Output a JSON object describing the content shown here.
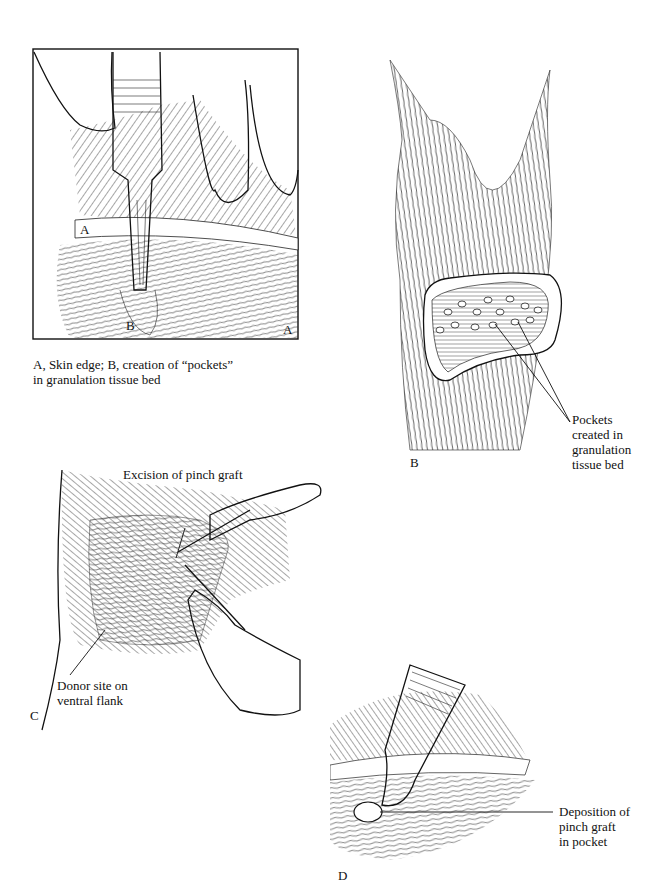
{
  "figure": {
    "panels": [
      {
        "id": "A",
        "panel_letter": "A",
        "inner_labels": [
          "A",
          "B"
        ],
        "caption_line1": "A, Skin edge; B, creation of “pockets”",
        "caption_line2": "in granulation tissue bed"
      },
      {
        "id": "B",
        "panel_letter": "B",
        "callout_lines": [
          "Pockets",
          "created in",
          "granulation",
          "tissue bed"
        ]
      },
      {
        "id": "C",
        "panel_letter": "C",
        "callout_top": "Excision of pinch graft",
        "callout_bottom_lines": [
          "Donor site on",
          "ventral flank"
        ]
      },
      {
        "id": "D",
        "panel_letter": "D",
        "callout_lines": [
          "Deposition of",
          "pinch graft",
          "in pocket"
        ]
      }
    ]
  }
}
